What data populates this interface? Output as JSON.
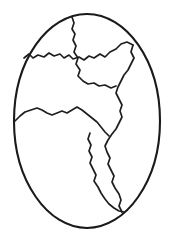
{
  "artwork": {
    "title": "Cracked Egg Outline",
    "subject": "egg-with-cracks",
    "style": "black-and-white line art",
    "background_color": "#ffffff",
    "outline_color": "#1a1a1a",
    "crack_color": "#1f1f1f",
    "outline_stroke_width": 2.1,
    "crack_stroke_width": 1.7,
    "canvas": {
      "width": 174,
      "height": 238
    },
    "egg": {
      "name": "egg-shell-outline",
      "center_x": 87,
      "center_y": 121,
      "radius_x": 73,
      "radius_y": 107,
      "path": "M 87 14 C 126 14 160 60 160 121 C 160 181 126 228 87 228 C 48 228 14 181 14 121 C 14 60 48 14 87 14 Z"
    },
    "cracks": [
      {
        "name": "crack-upper-left",
        "description": "zigzag crack from left rim across to upper right",
        "path": "M 24 58 L 29 54 L 33 58 L 38 55 L 44 57 L 49 53 L 54 56 L 60 54 L 64 58 L 69 55 L 73 59 L 79 57 L 84 60 L 89 56 L 94 58 L 100 54 L 105 57 L 110 52 L 116 49 L 121 44 L 127 42 L 133 45"
      },
      {
        "name": "crack-top-vertical",
        "description": "crack dropping from top rim down through upper middle",
        "path": "M 72 17 L 74 23 L 72 29 L 75 34 L 73 40 L 76 46 L 74 52 L 78 58 L 76 64 L 80 70 L 78 76 L 83 81 L 88 84 L 94 83 L 99 86 L 105 85 L 111 88 L 116 86"
      },
      {
        "name": "crack-right-descending",
        "description": "long jagged crack running down the right side",
        "path": "M 133 45 L 131 52 L 134 58 L 131 64 L 128 70 L 124 75 L 121 81 L 118 87 L 116 93 L 119 99 L 122 105 L 120 111 L 122 117 L 119 123 L 116 129 L 112 134 L 108 140 L 105 146 L 107 152 L 110 158 L 108 164 L 111 170 L 114 176 L 112 182 L 115 188 L 119 194 L 121 200 L 119 206 L 122 212"
      },
      {
        "name": "crack-middle-horizontal",
        "description": "zigzag crack from left rim across the middle to the junction",
        "path": "M 15 121 L 20 116 L 25 112 L 31 110 L 37 108 L 42 110 L 47 113 L 52 115 L 57 113 L 62 111 L 67 113 L 72 110 L 77 107 L 82 110 L 87 114 L 92 118 L 97 122 L 101 127 L 105 132 L 109 136"
      },
      {
        "name": "crack-lower-center",
        "description": "crack descending from the middle junction to the bottom rim",
        "path": "M 90 133 L 88 139 L 91 145 L 89 151 L 92 157 L 90 163 L 93 169 L 96 175 L 94 181 L 98 187 L 101 193 L 105 199 L 109 204 L 114 208 L 119 211 L 124 212"
      }
    ]
  }
}
